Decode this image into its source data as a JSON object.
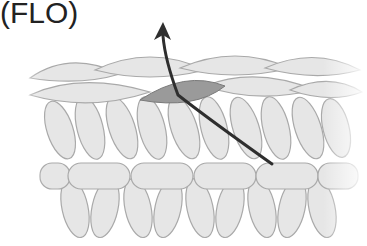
{
  "title": "(FLO)",
  "diagram": {
    "colors": {
      "loop_fill": "#e6e6e6",
      "loop_stroke": "#a9a9a9",
      "highlight_loop": "#9a9a9a",
      "arrow": "#2e2e2e"
    }
  }
}
